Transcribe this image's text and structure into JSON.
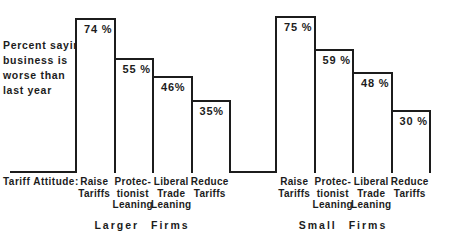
{
  "figure": {
    "background": "#ffffff",
    "ink_color": "#1c1c1c",
    "ylabel_lines": [
      "Percent saying",
      "business is",
      "worse than",
      "last year"
    ],
    "axis_label": "Tariff Attitude:"
  },
  "chart_data": {
    "type": "bar",
    "title": "",
    "ylabel": "Percent saying business is worse than last year",
    "xlabel": "Tariff Attitude",
    "ylim": [
      0,
      80
    ],
    "grid": false,
    "legend": "none",
    "bar_style": "white fill, black outline, adjacent step bars, value labels inside top of bars",
    "categories": [
      "Raise Tariffs",
      "Protectionist Leaning",
      "Liberal Trade Leaning",
      "Reduce Tariffs"
    ],
    "category_label_lines": [
      [
        "Raise",
        "Tariffs"
      ],
      [
        "Protec-",
        "tionist",
        "Leaning"
      ],
      [
        "Liberal",
        "Trade",
        "Leaning"
      ],
      [
        "Reduce",
        "Tariffs"
      ]
    ],
    "groups": [
      {
        "label": "Larger  Firms",
        "values": [
          74,
          55,
          46,
          35
        ],
        "value_labels": [
          "74 %",
          "55 %",
          "46%",
          "35%"
        ]
      },
      {
        "label": "Small  Firms",
        "values": [
          75,
          59,
          48,
          30
        ],
        "value_labels": [
          "75 %",
          "59 %",
          "48 %",
          "30 %"
        ]
      }
    ]
  }
}
